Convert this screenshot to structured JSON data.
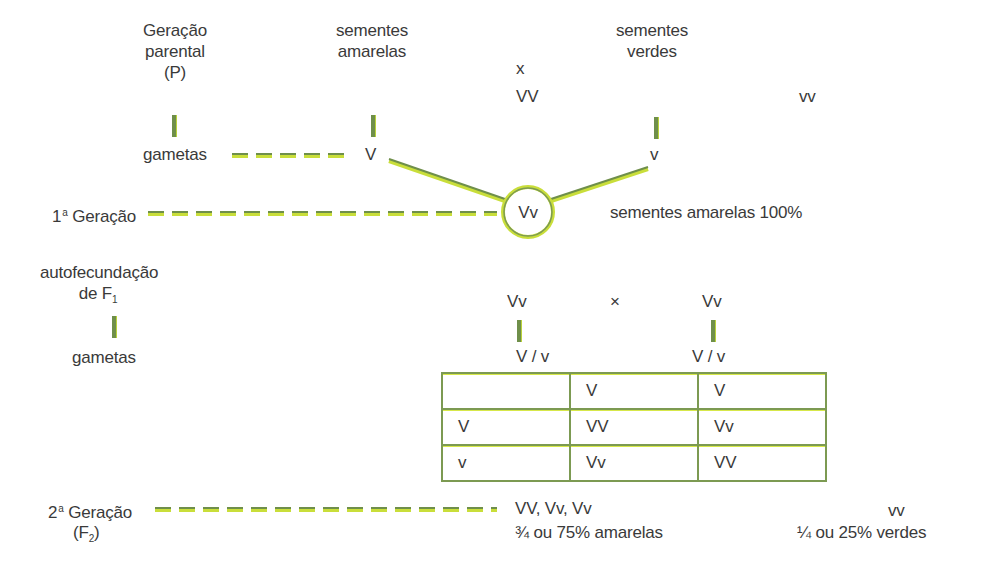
{
  "diagram": {
    "colors": {
      "line_dark": "#6f8f4a",
      "line_light": "#c9de3a",
      "text": "#3a3a3a"
    },
    "parental": {
      "label_line1": "Geração",
      "label_line2": "parental",
      "label_line3": "(P)",
      "parent1_line1": "sementes",
      "parent1_line2": "amarelas",
      "cross_symbol": "x",
      "parent1_genotype": "VV",
      "parent2_line1": "sementes",
      "parent2_line2": "verdes",
      "parent2_genotype": "vv",
      "gametes_label": "gametas",
      "gamete1": "V",
      "gamete2": "v"
    },
    "f1": {
      "label_ordinal": "1",
      "label_sup": "a",
      "label_text": "Geração",
      "genotype": "Vv",
      "phenotype": "sementes amarelas 100%"
    },
    "selfing": {
      "label_line1": "autofecundação",
      "label_line2_text": "de F",
      "label_line2_sub": "1",
      "parent1_genotype": "Vv",
      "cross_symbol": "×",
      "parent2_genotype": "Vv",
      "gametes_label": "gametas",
      "gametes1": "V / v",
      "gametes2": "V / v"
    },
    "punnett": {
      "rows": [
        [
          "",
          "V",
          "V"
        ],
        [
          "V",
          "VV",
          "Vv"
        ],
        [
          "v",
          "Vv",
          "VV"
        ]
      ]
    },
    "f2": {
      "label_ordinal": "2",
      "label_sup": "a",
      "label_text": "Geração",
      "label_line2_open": "(F",
      "label_line2_sub": "2",
      "label_line2_close": ")",
      "dominant_genotypes": "VV, Vv, Vv",
      "dominant_ratio": "¾ ou 75% amarelas",
      "recessive_genotype": "vv",
      "recessive_ratio": "¼ ou 25% verdes"
    }
  }
}
